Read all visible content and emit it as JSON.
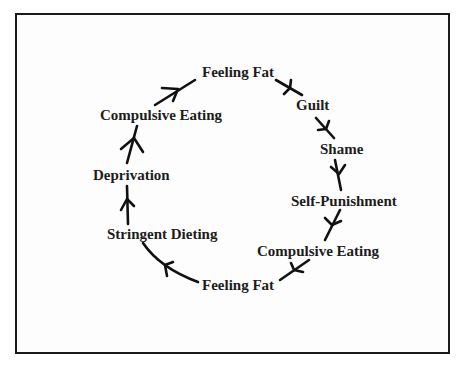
{
  "diagram": {
    "type": "cycle",
    "nodes": [
      {
        "id": "feeling-fat-top",
        "label": "Feeling Fat"
      },
      {
        "id": "guilt",
        "label": "Guilt"
      },
      {
        "id": "shame",
        "label": "Shame"
      },
      {
        "id": "self-punishment",
        "label": "Self-Punishment"
      },
      {
        "id": "compulsive-eating-right",
        "label": "Compulsive Eating"
      },
      {
        "id": "feeling-fat-bottom",
        "label": "Feeling Fat"
      },
      {
        "id": "stringent-dieting",
        "label": "Stringent Dieting"
      },
      {
        "id": "deprivation",
        "label": "Deprivation"
      },
      {
        "id": "compulsive-eating-left",
        "label": "Compulsive Eating"
      }
    ],
    "edges": [
      {
        "from": "feeling-fat-top",
        "to": "guilt"
      },
      {
        "from": "guilt",
        "to": "shame"
      },
      {
        "from": "shame",
        "to": "self-punishment"
      },
      {
        "from": "self-punishment",
        "to": "compulsive-eating-right"
      },
      {
        "from": "compulsive-eating-right",
        "to": "feeling-fat-bottom"
      },
      {
        "from": "feeling-fat-bottom",
        "to": "stringent-dieting"
      },
      {
        "from": "stringent-dieting",
        "to": "deprivation"
      },
      {
        "from": "deprivation",
        "to": "compulsive-eating-left"
      },
      {
        "from": "compulsive-eating-left",
        "to": "feeling-fat-top"
      }
    ]
  }
}
